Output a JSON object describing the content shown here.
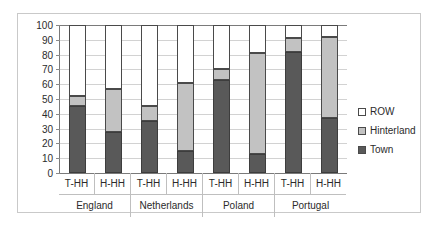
{
  "chart_data": {
    "type": "bar",
    "subtype": "stacked-column-100",
    "title": "",
    "xlabel": "",
    "ylabel": "",
    "ylim": [
      0,
      100
    ],
    "ytick_step": 10,
    "yticks": [
      100,
      90,
      80,
      70,
      60,
      50,
      40,
      30,
      20,
      10,
      0
    ],
    "grid": true,
    "legend_position": "right",
    "groups": [
      "England",
      "Netherlands",
      "Poland",
      "Portugal"
    ],
    "subcategories": [
      "T-HH",
      "H-HH"
    ],
    "categories": [
      "England T-HH",
      "England H-HH",
      "Netherlands T-HH",
      "Netherlands H-HH",
      "Poland T-HH",
      "Poland H-HH",
      "Portugal T-HH",
      "Portugal H-HH"
    ],
    "series": [
      {
        "name": "Town",
        "color": "#595959",
        "values": [
          45,
          28,
          35,
          15,
          63,
          13,
          82,
          37
        ]
      },
      {
        "name": "Hinterland",
        "color": "#c2c2c2",
        "values": [
          7,
          29,
          10,
          46,
          7,
          68,
          9,
          55
        ]
      },
      {
        "name": "ROW",
        "color": "#ffffff",
        "values": [
          48,
          43,
          55,
          39,
          30,
          19,
          9,
          8
        ]
      }
    ],
    "cumulative_tops": {
      "town": [
        45,
        28,
        35,
        15,
        63,
        13,
        82,
        37
      ],
      "hinterland": [
        52,
        57,
        45,
        61,
        70,
        81,
        91,
        92
      ],
      "row": [
        100,
        100,
        100,
        100,
        100,
        100,
        100,
        100
      ]
    }
  },
  "axis": {
    "y_tick_labels": [
      "100",
      "90",
      "80",
      "70",
      "60",
      "50",
      "40",
      "30",
      "20",
      "10",
      "0"
    ]
  },
  "x_axis": {
    "sub_labels": [
      "T-HH",
      "H-HH",
      "T-HH",
      "H-HH",
      "T-HH",
      "H-HH",
      "T-HH",
      "H-HH"
    ],
    "group_labels": [
      "England",
      "Netherlands",
      "Poland",
      "Portugal"
    ]
  },
  "legend": {
    "items": [
      {
        "label": "ROW",
        "swatch": "row"
      },
      {
        "label": "Hinterland",
        "swatch": "hinterland"
      },
      {
        "label": "Town",
        "swatch": "town"
      }
    ]
  }
}
